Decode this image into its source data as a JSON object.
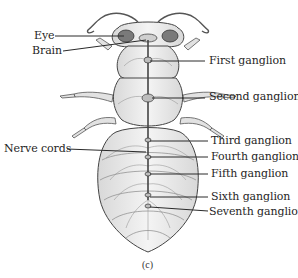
{
  "diagram": {
    "caption": "(c)",
    "labels_left": [
      {
        "id": "eye",
        "text": "Eye"
      },
      {
        "id": "brain",
        "text": "Brain"
      },
      {
        "id": "nerve-cords",
        "text": "Nerve cords"
      }
    ],
    "labels_right": [
      {
        "id": "first-ganglion",
        "text": "First ganglion"
      },
      {
        "id": "second-ganglion",
        "text": "Second ganglion"
      },
      {
        "id": "third-ganglion",
        "text": "Third ganglion"
      },
      {
        "id": "fourth-ganglion",
        "text": "Fourth ganglion"
      },
      {
        "id": "fifth-ganglion",
        "text": "Fifth ganglion"
      },
      {
        "id": "sixth-ganglion",
        "text": "Sixth ganglion"
      },
      {
        "id": "seventh-ganglion",
        "text": "Seventh ganglion"
      }
    ],
    "colors": {
      "ink": "#3a3a3a",
      "body_fill": "#ececec",
      "eye_fill": "#7a7a7a",
      "leader_line": "#2a2a2a"
    }
  }
}
